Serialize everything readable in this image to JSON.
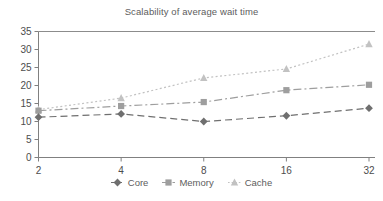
{
  "chart_data": {
    "type": "line",
    "title": "Scalability of average wait time",
    "xlabel": "",
    "ylabel": "",
    "categories": [
      "2",
      "4",
      "8",
      "16",
      "32"
    ],
    "x": [
      2,
      4,
      8,
      16,
      32
    ],
    "xtick_labels": [
      "2",
      "4",
      "8",
      "16",
      "32"
    ],
    "ytick_labels": [
      "0",
      "5",
      "10",
      "15",
      "20",
      "25",
      "30",
      "35"
    ],
    "yticks": [
      0,
      5,
      10,
      15,
      20,
      25,
      30,
      35
    ],
    "ylim": [
      0,
      35
    ],
    "grid": false,
    "legend_position": "bottom",
    "series": [
      {
        "name": "Core",
        "values": [
          11.2,
          12.1,
          10.0,
          11.6,
          13.7
        ],
        "marker": "diamond",
        "color": "#6f6f6f",
        "line_style": "dashed"
      },
      {
        "name": "Memory",
        "values": [
          13.0,
          14.3,
          15.4,
          18.7,
          20.2
        ],
        "marker": "square",
        "color": "#9e9e9e",
        "line_style": "dash-dot"
      },
      {
        "name": "Cache",
        "values": [
          13.3,
          16.5,
          22.1,
          24.6,
          31.5
        ],
        "marker": "triangle",
        "color": "#c2c2c2",
        "line_style": "dotted"
      }
    ]
  },
  "axis": {
    "line_color": "#808080",
    "top_rule_color": "#8c8c8c"
  },
  "legend": {
    "items": [
      {
        "label": "Core",
        "marker": "diamond-marker-icon"
      },
      {
        "label": "Memory",
        "marker": "square-marker-icon"
      },
      {
        "label": "Cache",
        "marker": "triangle-marker-icon"
      }
    ]
  }
}
